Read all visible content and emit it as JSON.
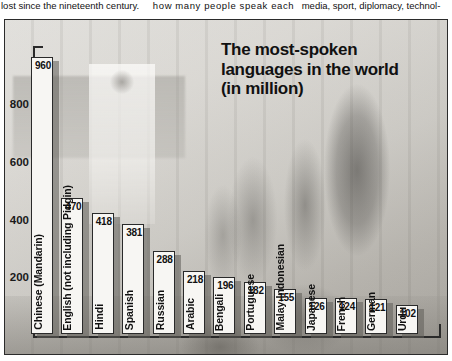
{
  "article": {
    "column_1": "lost since the nineteenth century.",
    "column_2": "how many people speak each",
    "column_3": "media, sport, diplomacy, technol-"
  },
  "chart_title": {
    "line_1": "The most-spoken",
    "line_2": "languages in the world",
    "line_3": "(in million)"
  },
  "axis": {
    "y_ticks": [
      "200",
      "400",
      "600",
      "800"
    ]
  },
  "colors": {
    "bar_fill": "#f7f6f3",
    "bar_outline": "#2a2a2a",
    "bar_shadow": "#5f5c57",
    "axis": "#2a2a2a",
    "text": "#111111",
    "frame_border": "#2b2b2b"
  },
  "chart_data": {
    "type": "bar",
    "title": "The most-spoken languages in the world (in million)",
    "xlabel": "",
    "ylabel": "",
    "ylim": [
      0,
      1000
    ],
    "grid": false,
    "legend": "none",
    "unit": "million speakers",
    "categories": [
      "Chinese (Mandarin)",
      "English (not including Pidgin)",
      "Hindi",
      "Spanish",
      "Russian",
      "Arabic",
      "Bengali",
      "Portuguese",
      "Malay-Indonesian",
      "Japanese",
      "French",
      "German",
      "Urdu"
    ],
    "values": [
      960,
      470,
      418,
      381,
      288,
      218,
      196,
      182,
      155,
      126,
      124,
      121,
      102
    ],
    "value_labels": [
      "960",
      "470",
      "418",
      "381",
      "288",
      "218",
      "196",
      "182",
      "155",
      "126",
      "124",
      "121",
      "102"
    ],
    "ytick_values": [
      200,
      400,
      600,
      800
    ]
  }
}
